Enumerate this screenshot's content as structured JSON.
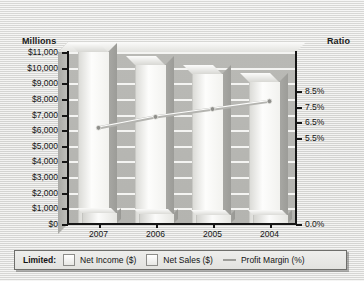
{
  "chart_data": {
    "type": "bar",
    "title": "",
    "categories": [
      "2007",
      "2006",
      "2005",
      "2004"
    ],
    "left_axis": {
      "label": "Millions",
      "ticks": [
        "$11,000",
        "$10,000",
        "$9,000",
        "$8,000",
        "$7,000",
        "$6,000",
        "$5,000",
        "$4,000",
        "$3,000",
        "$2,000",
        "$1,000",
        "$0"
      ],
      "tick_values": [
        11000,
        10000,
        9000,
        8000,
        7000,
        6000,
        5000,
        4000,
        3000,
        2000,
        1000,
        0
      ],
      "ylim": [
        0,
        11000
      ]
    },
    "right_axis": {
      "label": "Ratio",
      "ticks": [
        "8.5%",
        "7.5%",
        "6.5%",
        "5.5%",
        "0.0%"
      ],
      "tick_values": [
        8.5,
        7.5,
        6.5,
        5.5,
        0.0
      ],
      "ylim": [
        0.0,
        11.0
      ]
    },
    "series": [
      {
        "name": "Net Sales ($)",
        "type": "bar",
        "axis": "left",
        "values": [
          11000,
          10200,
          9600,
          9100
        ]
      },
      {
        "name": "Net Income ($)",
        "type": "bar",
        "axis": "left",
        "values": [
          700,
          650,
          600,
          550
        ]
      },
      {
        "name": "Profit Margin (%)",
        "type": "line",
        "axis": "right",
        "values": [
          6.15,
          6.85,
          7.35,
          7.85
        ]
      }
    ],
    "grid": "horizontal",
    "legend_position": "bottom"
  },
  "axis_titles": {
    "left": "Millions",
    "right": "Ratio"
  },
  "legend": {
    "prefix": "Limited:",
    "items": [
      {
        "label": "Net Income ($)",
        "marker": "square-light"
      },
      {
        "label": "Net Sales ($)",
        "marker": "square-white"
      },
      {
        "label": "Profit Margin (%)",
        "marker": "line-gray"
      }
    ]
  },
  "colors": {
    "backwall": "#b7b7b3",
    "gridline": "#f4f4f2",
    "bar_sales": "#fbfbfa",
    "bar_income": "#f0f0ec",
    "line": "#b4b4b0",
    "axis": "#161616",
    "page_background": "#e8e8e6"
  }
}
